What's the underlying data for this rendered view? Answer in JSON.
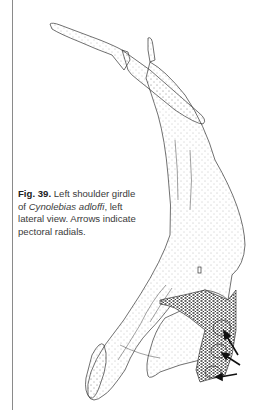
{
  "figure": {
    "label": "Fig. 39.",
    "caption_part1": " Left shoulder girdle of ",
    "species": "Cynolebias adloffi",
    "caption_part2": ", left lateral view. Arrows indicate pectoral radials.",
    "illustration": "shoulder-girdle-drawing",
    "arrow_count": 3
  }
}
